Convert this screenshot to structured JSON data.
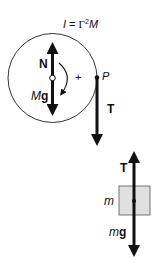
{
  "diagram": {
    "title_equation": {
      "I": "I",
      "eq": " = ",
      "Gamma": "Γ",
      "exp": "2",
      "M": "M"
    },
    "pulley": {
      "normal_label": "N",
      "weight_label_italic": "M",
      "weight_label_bold": "g",
      "rotation_sign": "+",
      "contact_point_label": "P",
      "tension_label": "T"
    },
    "block": {
      "tension_label": "T",
      "mass_label": "m",
      "weight_label_italic": "m",
      "weight_label_bold": "g"
    },
    "colors": {
      "stroke": "#111111",
      "block_fill": "#e0e0e0",
      "background": "#ffffff"
    }
  }
}
